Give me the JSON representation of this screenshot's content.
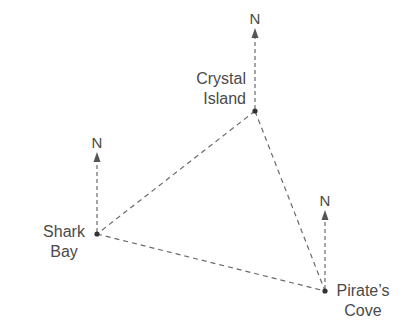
{
  "diagram": {
    "type": "bearing-triangle",
    "line_color": "#6a6a6a",
    "text_color": "#4a4a4a",
    "north_label": "N",
    "locations": [
      {
        "id": "crystal",
        "name_line1": "Crystal",
        "name_line2": "Island",
        "x": 255,
        "y": 111
      },
      {
        "id": "shark",
        "name_line1": "Shark",
        "name_line2": "Bay",
        "x": 97,
        "y": 234
      },
      {
        "id": "pirate",
        "name_line1": "Pirate’s",
        "name_line2": "Cove",
        "x": 325,
        "y": 291
      }
    ],
    "edges": [
      {
        "from": "crystal",
        "to": "shark"
      },
      {
        "from": "crystal",
        "to": "pirate"
      },
      {
        "from": "shark",
        "to": "pirate"
      }
    ]
  }
}
